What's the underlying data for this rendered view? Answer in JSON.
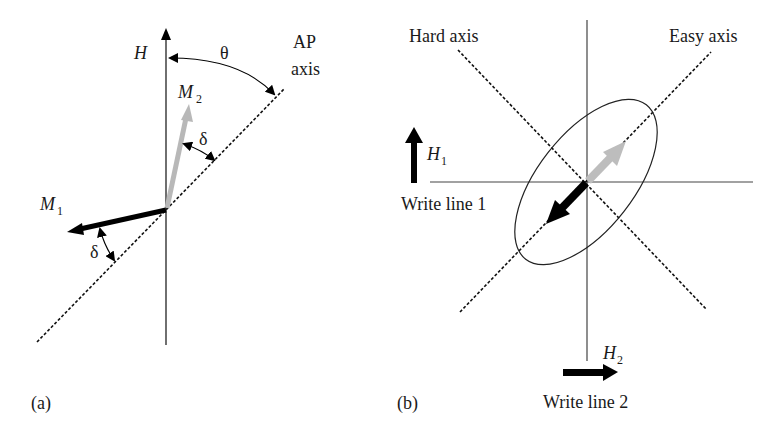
{
  "panel_a": {
    "caption": "(a)",
    "field_label": "H",
    "theta_label": "θ",
    "ap_axis_label_line1": "AP",
    "ap_axis_label_line2": "axis",
    "m1_label": "M",
    "m1_sub": "1",
    "m2_label": "M",
    "m2_sub": "2",
    "delta_upper": "δ",
    "delta_lower": "δ"
  },
  "panel_b": {
    "caption": "(b)",
    "hard_axis_label": "Hard axis",
    "easy_axis_label": "Easy axis",
    "h1_label": "H",
    "h1_sub": "1",
    "h2_label": "H",
    "h2_sub": "2",
    "write_line_1_label": "Write line 1",
    "write_line_2_label": "Write line 2"
  },
  "colors": {
    "line": "#333333",
    "dark_arrow": "#000000",
    "light_arrow": "#b8b8b8",
    "background": "#ffffff"
  }
}
